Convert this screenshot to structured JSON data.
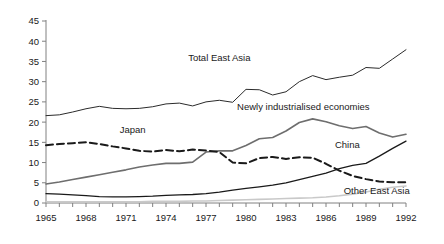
{
  "chart_data": {
    "type": "line",
    "title": "",
    "xlabel": "",
    "ylabel": "",
    "xlim": [
      1965,
      1992
    ],
    "ylim": [
      0,
      45
    ],
    "grid": false,
    "legend_position": "inline-annotations",
    "y_ticks": [
      "0",
      "5",
      "10",
      "15",
      "20",
      "25",
      "30",
      "35",
      "40",
      "45"
    ],
    "y_tick_values": [
      0,
      5,
      10,
      15,
      20,
      25,
      30,
      35,
      40,
      45
    ],
    "x_ticks": [
      "1965",
      "1968",
      "1971",
      "1974",
      "1977",
      "1980",
      "1983",
      "1986",
      "1989",
      "1992"
    ],
    "x_tick_values": [
      1965,
      1968,
      1971,
      1974,
      1977,
      1980,
      1983,
      1986,
      1989,
      1992
    ],
    "x": [
      1965,
      1966,
      1967,
      1968,
      1969,
      1970,
      1971,
      1972,
      1973,
      1974,
      1975,
      1976,
      1977,
      1978,
      1979,
      1980,
      1981,
      1982,
      1983,
      1984,
      1985,
      1986,
      1987,
      1988,
      1989,
      1990,
      1991,
      1992
    ],
    "series": [
      {
        "name": "Total East Asia",
        "label": "Total East Asia",
        "color": "#2b2b2b",
        "style": "solid",
        "width": 1,
        "label_x": 1978.0,
        "label_y": 35.2,
        "values": [
          21.6,
          21.8,
          22.5,
          23.3,
          23.9,
          23.4,
          23.3,
          23.4,
          23.8,
          24.5,
          24.7,
          24.0,
          25.0,
          25.4,
          24.9,
          28.1,
          28.0,
          26.7,
          27.5,
          30.0,
          31.5,
          30.5,
          31.1,
          31.6,
          33.5,
          33.3,
          35.6,
          37.9
        ]
      },
      {
        "name": "Newly industrialised economies",
        "label": "Newly industrialised economies",
        "color": "#6e6e6e",
        "style": "solid",
        "width": 1.6,
        "label_x": 1984.3,
        "label_y": 23.0,
        "values": [
          4.7,
          5.2,
          5.8,
          6.4,
          7.0,
          7.6,
          8.2,
          8.9,
          9.4,
          9.8,
          9.8,
          10.1,
          12.6,
          12.9,
          12.9,
          14.2,
          15.9,
          16.2,
          17.8,
          19.9,
          20.8,
          20.1,
          19.1,
          18.4,
          18.9,
          17.3,
          16.3,
          17.0
        ]
      },
      {
        "name": "Japan",
        "label": "Japan",
        "color": "#1a1a1a",
        "style": "dashed",
        "width": 2,
        "label_x": 1971.5,
        "label_y": 17.3,
        "values": [
          14.3,
          14.6,
          14.8,
          15.0,
          14.6,
          14.0,
          13.5,
          12.9,
          12.7,
          13.1,
          12.8,
          13.2,
          13.0,
          12.6,
          10.0,
          9.8,
          11.1,
          11.4,
          10.9,
          11.3,
          11.2,
          9.7,
          8.0,
          6.7,
          5.9,
          5.3,
          5.1,
          5.1
        ]
      },
      {
        "name": "China",
        "label": "China",
        "color": "#1a1a1a",
        "style": "solid",
        "width": 1.3,
        "label_x": 1987.6,
        "label_y": 13.6,
        "values": [
          2.3,
          2.2,
          2.0,
          1.8,
          1.6,
          1.5,
          1.5,
          1.6,
          1.7,
          1.9,
          2.0,
          2.1,
          2.3,
          2.7,
          3.2,
          3.6,
          4.0,
          4.4,
          5.0,
          5.8,
          6.6,
          7.4,
          8.5,
          9.3,
          9.8,
          11.6,
          13.5,
          15.3
        ]
      },
      {
        "name": "Other East Asia",
        "label": "Other East Asia",
        "color": "#c9c9c9",
        "style": "solid",
        "width": 1.6,
        "label_x": 1989.8,
        "label_y": 2.3,
        "values": [
          0.3,
          0.3,
          0.3,
          0.3,
          0.3,
          0.3,
          0.3,
          0.3,
          0.4,
          0.4,
          0.4,
          0.5,
          0.5,
          0.6,
          0.7,
          0.8,
          0.9,
          1.0,
          1.1,
          1.2,
          1.3,
          1.5,
          1.8,
          2.2,
          2.7,
          3.4,
          3.9,
          4.2
        ]
      }
    ]
  }
}
